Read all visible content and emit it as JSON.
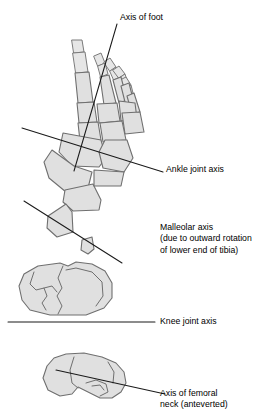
{
  "figure": {
    "background_color": "#ffffff",
    "bone_fill_color": "#e0e0e0",
    "bone_outline_color": "#6f6f6f",
    "axis_line_color": "#1a1a1a",
    "text_color": "#000000"
  },
  "labels": {
    "axis_of_foot": "Axis of foot",
    "ankle_joint_axis": "Ankle joint axis",
    "malleolar_axis_line1": "Malleolar axis",
    "malleolar_axis_line2": "(due to outward rotation",
    "malleolar_axis_line3": "of lower end of tibia)",
    "knee_joint_axis": "Knee joint axis",
    "femoral_neck_line1": "Axis of femoral",
    "femoral_neck_line2": "neck (anteverted)"
  },
  "panels": [
    {
      "name": "foot",
      "label": "Axis of foot",
      "secondary_label": "Ankle joint axis",
      "description": "Dorsal view of foot skeleton with long axis and oblique ankle joint axis"
    },
    {
      "name": "malleoli",
      "label": "Malleolar axis (due to outward rotation of lower end of tibia)",
      "description": "Cross section through medial and lateral malleoli with oblique axis"
    },
    {
      "name": "knee",
      "label": "Knee joint axis",
      "description": "Tibial plateau with horizontal knee joint axis"
    },
    {
      "name": "femur",
      "label": "Axis of femoral neck (anteverted)",
      "description": "Proximal femur viewed from above with anteverted neck axis"
    }
  ]
}
